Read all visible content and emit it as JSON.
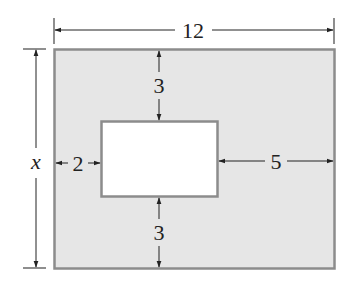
{
  "diagram": {
    "type": "dimensioned-rectangle-with-cutout",
    "colors": {
      "outer_fill": "#e6e6e6",
      "outer_stroke": "#8c8c8c",
      "inner_fill": "#ffffff",
      "line": "#222222"
    },
    "outer_rectangle": {
      "width_label": "12",
      "height_label": "x"
    },
    "inner_rectangle": {
      "top_margin_label": "3",
      "bottom_margin_label": "3",
      "left_margin_label": "2",
      "right_margin_label": "5"
    }
  }
}
